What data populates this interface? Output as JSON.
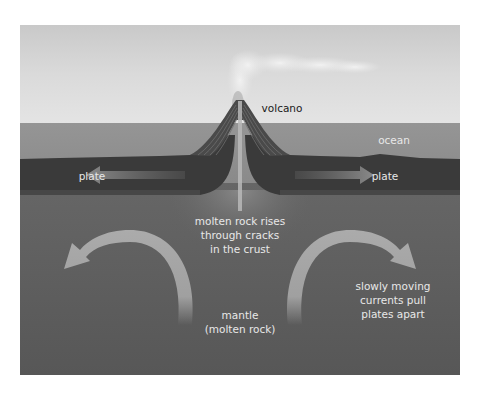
{
  "diagram": {
    "type": "cross-section",
    "labels": {
      "volcano": "volcano",
      "ocean": "ocean",
      "plate_left": "plate",
      "plate_right": "plate",
      "molten_rises": "molten rock rises\nthrough cracks\nin the crust",
      "currents": "slowly moving\ncurrents pull\nplates apart",
      "mantle": "mantle\n(molten rock)"
    },
    "layers": [
      {
        "name": "sky",
        "color": "#d6d6d6"
      },
      {
        "name": "ocean",
        "color": "#8f8f8f"
      },
      {
        "name": "plate",
        "color": "#3a3a3a"
      },
      {
        "name": "mantle",
        "color": "#5c5c5c"
      }
    ],
    "arrows": [
      {
        "name": "plate-left-arrow",
        "direction": "left"
      },
      {
        "name": "plate-right-arrow",
        "direction": "right"
      },
      {
        "name": "convection-left-arrow",
        "direction": "counterclockwise-up-left"
      },
      {
        "name": "convection-right-arrow",
        "direction": "clockwise-up-right"
      }
    ],
    "colors": {
      "arrow": "#a9a9a9",
      "label_light": "#e8e8e8",
      "label_dark": "#1a1a1a"
    }
  }
}
